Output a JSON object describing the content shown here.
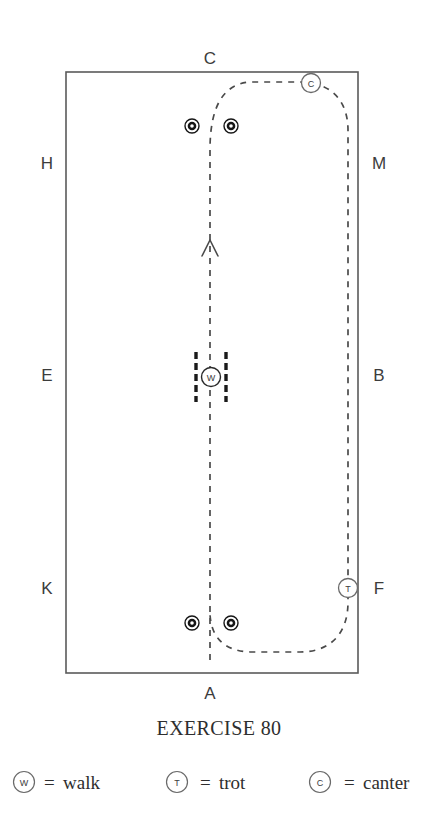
{
  "exercise": {
    "title": "EXERCISE 80",
    "diagram_type": "dressage-arena-exercise"
  },
  "arena": {
    "letters": {
      "top": "C",
      "bottom": "A",
      "left": [
        "H",
        "E",
        "K"
      ],
      "right": [
        "M",
        "B",
        "F"
      ]
    },
    "top_label": "C",
    "bottom_label": "A",
    "left_labels": [
      {
        "id": "H",
        "text": "H"
      },
      {
        "id": "E",
        "text": "E"
      },
      {
        "id": "K",
        "text": "K"
      }
    ],
    "right_labels": [
      {
        "id": "M",
        "text": "M"
      },
      {
        "id": "B",
        "text": "B"
      },
      {
        "id": "F",
        "text": "F"
      }
    ]
  },
  "gait_markers": [
    {
      "id": "canter-marker",
      "letter": "C",
      "gait": "canter"
    },
    {
      "id": "walk-marker",
      "letter": "W",
      "gait": "walk"
    },
    {
      "id": "trot-marker",
      "letter": "T",
      "gait": "trot"
    }
  ],
  "legend": {
    "items": [
      {
        "symbol": "W",
        "equals": "=",
        "label": "walk"
      },
      {
        "symbol": "T",
        "equals": "=",
        "label": "trot"
      },
      {
        "symbol": "C",
        "equals": "=",
        "label": "canter"
      }
    ]
  },
  "colors": {
    "arena_wall": "#5a5a5a",
    "path": "#444444",
    "text": "#2e2e2e",
    "cone": "#111111"
  }
}
